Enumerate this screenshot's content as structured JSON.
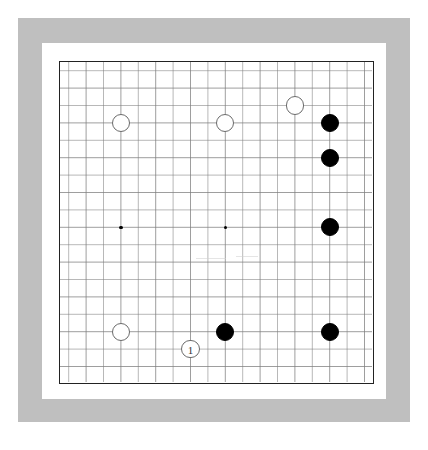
{
  "domain": "Game",
  "colors": {
    "page_background": "#ffffff",
    "outer_frame": "#bfbfbf",
    "inner_mat": "#ffffff",
    "board_background": "#ffffff",
    "board_border": "#222222",
    "grid_line": "#7d7d7d",
    "black_stone": "#000000",
    "white_stone": "#ffffff",
    "white_stone_outline": "#6b6b6b"
  },
  "board": {
    "name": "go-board",
    "columns": 19,
    "rows": 19,
    "cell_size": 17.4,
    "origin_x": 8.7,
    "origin_y": 8.7,
    "hoshi_points": [
      {
        "col": 3,
        "row": 9
      },
      {
        "col": 9,
        "row": 9
      }
    ],
    "stones": [
      {
        "id": "w1",
        "color": "white",
        "col": 3,
        "row": 3,
        "label": ""
      },
      {
        "id": "w2",
        "color": "white",
        "col": 9,
        "row": 3,
        "label": ""
      },
      {
        "id": "w3",
        "color": "white",
        "col": 13,
        "row": 2,
        "label": ""
      },
      {
        "id": "b1",
        "color": "black",
        "col": 15,
        "row": 3,
        "label": ""
      },
      {
        "id": "b2",
        "color": "black",
        "col": 15,
        "row": 5,
        "label": ""
      },
      {
        "id": "b3",
        "color": "black",
        "col": 15,
        "row": 9,
        "label": ""
      },
      {
        "id": "b4",
        "color": "black",
        "col": 15,
        "row": 15,
        "label": ""
      },
      {
        "id": "w4",
        "color": "white",
        "col": 3,
        "row": 15,
        "label": ""
      },
      {
        "id": "b5",
        "color": "black",
        "col": 9,
        "row": 15,
        "label": ""
      },
      {
        "id": "w5",
        "color": "white",
        "col": 7,
        "row": 16,
        "label": "1"
      }
    ],
    "move_labels": [
      {
        "number": "1",
        "color": "white",
        "col": 7,
        "row": 16
      }
    ]
  },
  "caption": ""
}
